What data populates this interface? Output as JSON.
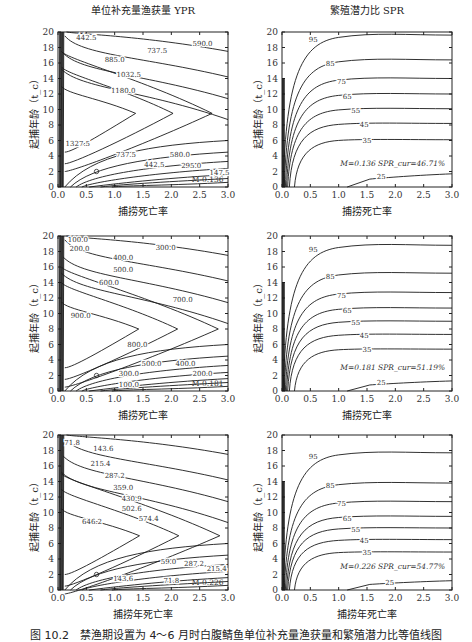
{
  "caption": "图 10.2　禁渔期设置为 4～6 月时白腹鲭鱼单位补充量渔获量和繁殖潜力比等值线图",
  "chart_data": [
    {
      "type": "contour",
      "panel": "row1-left",
      "title": "单位补充量渔获量 YPR",
      "xlabel": "捕捞死亡率",
      "ylabel": "起捕年龄（t_c）",
      "xlim": [
        0,
        3.0
      ],
      "ylim": [
        0,
        20
      ],
      "xticks": [
        "0.0",
        "0.5",
        "1.0",
        "1.5",
        "2.0",
        "2.5",
        "3.0"
      ],
      "yticks": [
        "0",
        "2",
        "4",
        "6",
        "8",
        "10",
        "12",
        "14",
        "16",
        "18",
        "20"
      ],
      "contour_levels": [
        "147.5",
        "295.0",
        "442.5",
        "580.0",
        "737.5",
        "885.0",
        "1032.5",
        "1180.0",
        "1327.5",
        "590.0"
      ],
      "peak": {
        "t_c": 9.5
      },
      "annotation": "M-0.136",
      "marked_point": {
        "F": 0.7,
        "t_c": 2
      }
    },
    {
      "type": "contour",
      "panel": "row1-right",
      "title": "繁殖潜力比 SPR",
      "xlabel": "捕捞死亡率",
      "ylabel": "起捕年龄（t_c）",
      "xlim": [
        0,
        3.0
      ],
      "ylim": [
        0,
        20
      ],
      "xticks": [
        "0.0",
        "0.5",
        "1.0",
        "1.5",
        "2.0",
        "2.5",
        "3.0"
      ],
      "yticks": [
        "0",
        "2",
        "4",
        "6",
        "8",
        "10",
        "12",
        "14",
        "16",
        "18",
        "20"
      ],
      "contour_levels": [
        "25",
        "35",
        "45",
        "55",
        "65",
        "75",
        "85",
        "95"
      ],
      "asymptotes_tc": {
        "95": 19.6,
        "85": 16.4,
        "75": 14.0,
        "65": 12.0,
        "55": 10.1,
        "45": 8.2,
        "35": 6.1,
        "25": 1.7
      },
      "annotation": "M=0.136 SPR_cur=46.71%"
    },
    {
      "type": "contour",
      "panel": "row2-left",
      "title": "",
      "xlabel": "捕捞死亡率",
      "ylabel": "起捕年龄（t_c）",
      "xlim": [
        0,
        3.0
      ],
      "ylim": [
        0,
        20
      ],
      "xticks": [
        "0.0",
        "0.5",
        "1.0",
        "1.5",
        "2.0",
        "2.5",
        "3.0"
      ],
      "yticks": [
        "0",
        "2",
        "4",
        "6",
        "8",
        "10",
        "12",
        "14",
        "16",
        "18",
        "20"
      ],
      "contour_levels": [
        "100.0",
        "200.0",
        "300.0",
        "400.0",
        "500.0",
        "600.0",
        "700.0",
        "800.0",
        "900.0"
      ],
      "peak": {
        "t_c": 8
      },
      "annotation": "M-0.181",
      "marked_point": {
        "F": 0.65,
        "t_c": 2
      }
    },
    {
      "type": "contour",
      "panel": "row2-right",
      "title": "",
      "xlabel": "捕捞死亡率",
      "ylabel": "起捕年龄（t_c）",
      "xlim": [
        0,
        3.0
      ],
      "ylim": [
        0,
        20
      ],
      "xticks": [
        "0.0",
        "0.5",
        "1.0",
        "1.5",
        "2.0",
        "2.5",
        "3.0"
      ],
      "yticks": [
        "0",
        "2",
        "4",
        "6",
        "8",
        "10",
        "12",
        "14",
        "16",
        "18",
        "20"
      ],
      "contour_levels": [
        "25",
        "35",
        "45",
        "55",
        "65",
        "75",
        "85",
        "95"
      ],
      "asymptotes_tc": {
        "95": 18.8,
        "85": 15.2,
        "75": 12.7,
        "65": 10.7,
        "55": 9.0,
        "45": 7.3,
        "35": 5.4,
        "25": 1.3
      },
      "annotation": "M=0.181 SPR_cur=51.19%"
    },
    {
      "type": "contour",
      "panel": "row3-left",
      "title": "",
      "xlabel": "捕捞年死亡率",
      "ylabel": "起捕年龄（t_c）",
      "xlim": [
        0,
        3.0
      ],
      "ylim": [
        0,
        20
      ],
      "xticks": [
        "0.0",
        "0.5",
        "1.0",
        "1.5",
        "2.0",
        "2.5",
        "3.0"
      ],
      "yticks": [
        "0",
        "2",
        "4",
        "6",
        "8",
        "10",
        "12",
        "14",
        "16",
        "18",
        "20"
      ],
      "contour_levels": [
        "71.8",
        "143.6",
        "215.4",
        "287.2",
        "359.0",
        "430.9",
        "502.6",
        "574.4",
        "646.2",
        "59.0"
      ],
      "peak": {
        "t_c": 7
      },
      "annotation": "M-0.226",
      "marked_point": {
        "F": 0.6,
        "t_c": 2
      }
    },
    {
      "type": "contour",
      "panel": "row3-right",
      "title": "",
      "xlabel": "捕捞年死亡率",
      "ylabel": "起捕年龄（t_c）",
      "xlim": [
        0,
        3.0
      ],
      "ylim": [
        0,
        20
      ],
      "xticks": [
        "0.0",
        "0.5",
        "1.0",
        "1.5",
        "2.0",
        "2.5",
        "3.0"
      ],
      "yticks": [
        "0",
        "2",
        "4",
        "6",
        "8",
        "10",
        "12",
        "14",
        "16",
        "18",
        "20"
      ],
      "contour_levels": [
        "25",
        "35",
        "45",
        "55",
        "65",
        "75",
        "85",
        "95"
      ],
      "asymptotes_tc": {
        "95": 17.7,
        "85": 13.8,
        "75": 11.4,
        "65": 9.5,
        "55": 8.0,
        "45": 6.5,
        "35": 4.9,
        "25": 1.2
      },
      "annotation": "M=0.226 SPR_cur=54.77%"
    }
  ],
  "panels": {
    "p1": {
      "title": "单位补充量渔获量 YPR",
      "xlabel": "捕捞死亡率",
      "ylabel": "起捕年龄（t_c）",
      "annotation": "M-0.136",
      "labels": [
        "442.5",
        "590.0",
        "737.5",
        "885.0",
        "1032.5",
        "1180.0",
        "1327.5",
        "737.5",
        "580.0",
        "442.5",
        "295.0",
        "147.5"
      ]
    },
    "p2": {
      "title": "繁殖潜力比 SPR",
      "xlabel": "捕捞死亡率",
      "ylabel": "起捕年龄（t_c）",
      "annotation": "M=0.136 SPR_cur=46.71%",
      "labels": [
        "95",
        "85",
        "75",
        "65",
        "55",
        "45",
        "35",
        "25"
      ]
    },
    "p3": {
      "xlabel": "捕捞死亡率",
      "ylabel": "起捕年龄（t_c）",
      "annotation": "M-0.181",
      "labels": [
        "100.0",
        "200.0",
        "300.0",
        "400.0",
        "500.0",
        "600.0",
        "700.0",
        "900.0",
        "800.0",
        "500.0",
        "400.0",
        "300.0",
        "200.0",
        "100.0"
      ]
    },
    "p4": {
      "xlabel": "捕捞死亡率",
      "ylabel": "起捕年龄（t_c）",
      "annotation": "M=0.181 SPR_cur=51.19%",
      "labels": [
        "95",
        "85",
        "75",
        "65",
        "55",
        "45",
        "35",
        "25"
      ]
    },
    "p5": {
      "xlabel": "捕捞年死亡率",
      "ylabel": "起捕年龄（t_c）",
      "annotation": "M-0.226",
      "labels": [
        "71.8",
        "143.6",
        "215.4",
        "287.2",
        "359.0",
        "430.9",
        "502.6",
        "574.4",
        "646.2",
        "59.0",
        "287.2",
        "215.4",
        "143.6",
        "71.8"
      ]
    },
    "p6": {
      "xlabel": "捕捞年死亡率",
      "ylabel": "起捕年龄（t_c）",
      "annotation": "M=0.226 SPR_cur=54.77%",
      "labels": [
        "95",
        "85",
        "75",
        "65",
        "55",
        "45",
        "35",
        "25"
      ]
    }
  },
  "axis": {
    "xticks": [
      "0.0",
      "0.5",
      "1.0",
      "1.5",
      "2.0",
      "2.5",
      "3.0"
    ],
    "yticks": [
      "0",
      "2",
      "4",
      "6",
      "8",
      "10",
      "12",
      "14",
      "16",
      "18",
      "20"
    ]
  }
}
